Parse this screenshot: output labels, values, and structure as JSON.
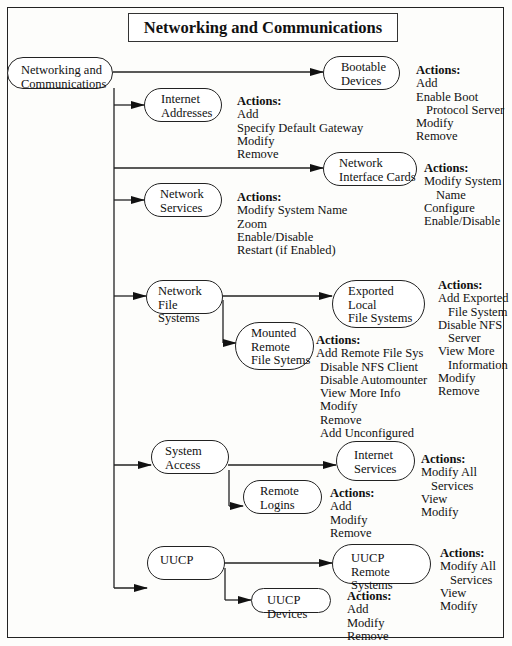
{
  "title": "Networking and Communications",
  "root": {
    "label": "Networking and\nCommunications"
  },
  "actions_header": "Actions:",
  "nodes": {
    "bootable_devices": {
      "label": "Bootable\nDevices",
      "actions": [
        "Add",
        "Enable Boot",
        "  Protocol Server",
        "Modify",
        "Remove"
      ]
    },
    "internet_addresses": {
      "label": "Internet\nAddresses",
      "actions": [
        "Add",
        "Specify Default Gateway",
        "Modify",
        "Remove"
      ]
    },
    "network_interface_cards": {
      "label": "Network\nInterface Cards",
      "actions": [
        "Modify System",
        "  Name",
        "Configure",
        "Enable/Disable"
      ]
    },
    "network_services": {
      "label": "Network\nServices",
      "actions": [
        "Modify System Name",
        "Zoom",
        "Enable/Disable",
        "Restart (if Enabled)"
      ]
    },
    "network_file_systems": {
      "label": "Network File\nSystems"
    },
    "exported_local_fs": {
      "label": "Exported\nLocal\nFile Systems",
      "actions": [
        "Add Exported",
        "  File System",
        "Disable NFS",
        "  Server",
        "View More",
        "  Information",
        "Modify",
        "Remove"
      ]
    },
    "mounted_remote_fs": {
      "label": "Mounted\nRemote\nFile Sytems",
      "actions": [
        "Add Remote File Sys",
        "  Disable NFS Client",
        "  Disable Automounter",
        "  View More Info",
        "  Modify",
        "  Remove",
        "  Add Unconfigured"
      ]
    },
    "system_access": {
      "label": "System\nAccess"
    },
    "internet_services": {
      "label": "Internet\nServices",
      "actions": [
        "Modify All",
        "  Services",
        "View",
        "Modify"
      ]
    },
    "remote_logins": {
      "label": "Remote\nLogins",
      "actions": [
        "Add",
        "Modify",
        "Remove"
      ]
    },
    "uucp": {
      "label": "UUCP"
    },
    "uucp_remote_systems": {
      "label": "UUCP\nRemote Systems",
      "actions": [
        "Modify All",
        "  Services",
        "View",
        "Modify"
      ]
    },
    "uucp_devices": {
      "label": "UUCP Devices",
      "actions": [
        "Add",
        "Modify",
        "Remove"
      ]
    }
  },
  "colors": {
    "line": "#222222",
    "background": "#fdfdfb"
  }
}
